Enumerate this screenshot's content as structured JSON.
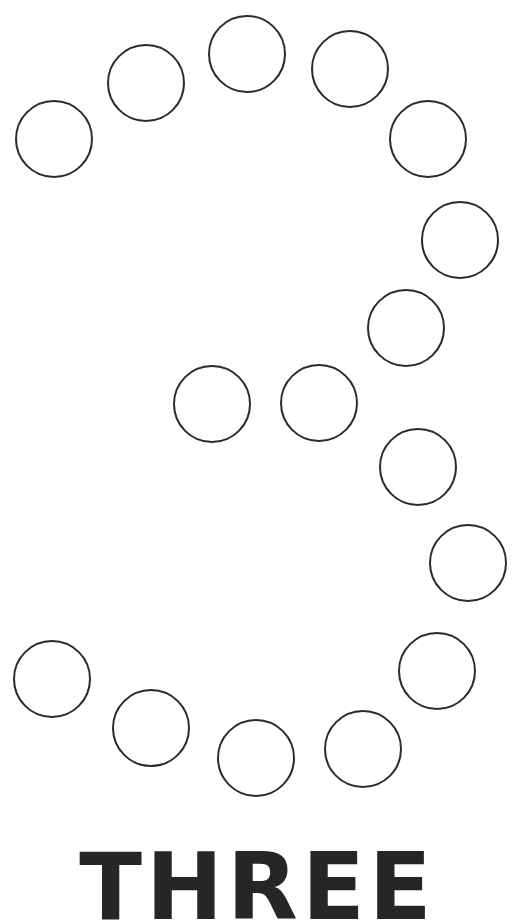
{
  "worksheet": {
    "digit": "3",
    "word": "THREE",
    "stroke_color": "#2b2b2b",
    "text_color": "#262626",
    "background": "#ffffff",
    "dot_radius": 38,
    "dots": [
      {
        "cx": 53,
        "cy": 138
      },
      {
        "cx": 145,
        "cy": 82
      },
      {
        "cx": 246,
        "cy": 53
      },
      {
        "cx": 349,
        "cy": 68
      },
      {
        "cx": 427,
        "cy": 138
      },
      {
        "cx": 459,
        "cy": 239
      },
      {
        "cx": 405,
        "cy": 327
      },
      {
        "cx": 211,
        "cy": 403
      },
      {
        "cx": 318,
        "cy": 402
      },
      {
        "cx": 417,
        "cy": 466
      },
      {
        "cx": 467,
        "cy": 562
      },
      {
        "cx": 436,
        "cy": 670
      },
      {
        "cx": 51,
        "cy": 678
      },
      {
        "cx": 150,
        "cy": 727
      },
      {
        "cx": 255,
        "cy": 757
      },
      {
        "cx": 362,
        "cy": 748
      }
    ]
  }
}
